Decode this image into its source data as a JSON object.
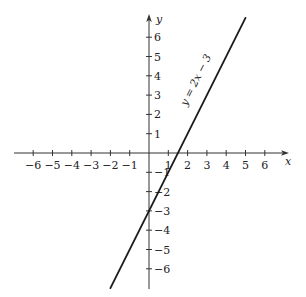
{
  "chart_data": {
    "type": "line",
    "title": "",
    "xlabel": "x",
    "ylabel": "y",
    "xlim": [
      -6.5,
      7
    ],
    "ylim": [
      -7,
      7
    ],
    "grid": false,
    "x_ticks": [
      -6,
      -5,
      -4,
      -3,
      -2,
      -1,
      1,
      2,
      3,
      4,
      5,
      6
    ],
    "y_ticks": [
      -6,
      -5,
      -4,
      -3,
      -2,
      -1,
      1,
      2,
      3,
      4,
      5,
      6
    ],
    "series": [
      {
        "name": "y = 2x − 3",
        "equation": "y = 2x − 3",
        "slope": 2,
        "intercept": -3,
        "x": [
          -2,
          5
        ],
        "y": [
          -7,
          7
        ]
      }
    ],
    "annotations": [
      {
        "text": "y = 2x − 3",
        "x": 2.3,
        "y": 2.3,
        "rotation_deg": -63.4
      }
    ]
  },
  "axes": {
    "x_label": "x",
    "y_label": "y"
  },
  "equation_label": "y = 2x − 3"
}
